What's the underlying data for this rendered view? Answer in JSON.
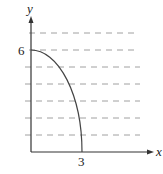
{
  "diagram": {
    "type": "quarter-ellipse-region",
    "axes": {
      "x_label": "x",
      "y_label": "y"
    },
    "tick_labels": {
      "x": "3",
      "y": "6"
    },
    "curve": {
      "description": "quarter ellipse from (0,6) to (3,0)",
      "equation": "x^2/9 + y^2/36 = 1"
    },
    "dashed_lines": {
      "count": 7,
      "orientation": "horizontal"
    },
    "colors": {
      "axis": "#333333",
      "curve": "#444444",
      "dash": "#9a9a9a"
    }
  }
}
